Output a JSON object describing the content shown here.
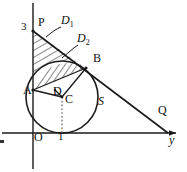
{
  "figure": {
    "axes": {
      "x_axis_name": "y",
      "origin_label": "O",
      "vertical_tick_label": "3",
      "horizontal_tick_label": "1",
      "axis_color": "#1a1a1a"
    },
    "points": [
      {
        "id": "P",
        "label": "P",
        "x": 38,
        "y": 22
      },
      {
        "id": "B",
        "label": "B",
        "x": 93,
        "y": 59
      },
      {
        "id": "A",
        "label": "A",
        "x": 25,
        "y": 91
      },
      {
        "id": "D",
        "label": "D",
        "x": 57,
        "y": 92
      },
      {
        "id": "C",
        "label": "C",
        "x": 67,
        "y": 99
      },
      {
        "id": "Q",
        "label": "Q",
        "x": 159,
        "y": 110
      },
      {
        "id": "S",
        "label": "S",
        "x": 99,
        "y": 101
      },
      {
        "id": "O",
        "label": "O",
        "x": 35,
        "y": 137
      }
    ],
    "region_labels": [
      {
        "id": "D1",
        "label": "D",
        "sub": "1",
        "x": 63,
        "y": 20
      },
      {
        "id": "D2",
        "label": "D",
        "sub": "2",
        "x": 79,
        "y": 38
      }
    ],
    "tick_labels": [
      {
        "id": "three",
        "label": "3",
        "x": 22,
        "y": 26
      },
      {
        "id": "one",
        "label": "1",
        "x": 58,
        "y": 137
      }
    ],
    "axis_labels": [
      {
        "id": "y-axis-label",
        "label": "y",
        "x": 170,
        "y": 140
      }
    ],
    "colors": {
      "stroke": "#1a1a1a",
      "hatch": "#222222",
      "background": "#ffffff",
      "dotted": "#555555"
    },
    "geometry": {
      "origin": [
        33,
        133
      ],
      "p_point": [
        33,
        31
      ],
      "q_point": [
        168,
        133
      ],
      "b_point": [
        86,
        68
      ],
      "a_point": [
        33,
        90
      ],
      "d_point": [
        55,
        90
      ],
      "circle_center": [
        62,
        97
      ],
      "circle_radius": 36,
      "y_axis_arrow_end": [
        176,
        133
      ],
      "x_axis_top": [
        33,
        3
      ],
      "x_axis_bottom": [
        33,
        169
      ]
    }
  }
}
